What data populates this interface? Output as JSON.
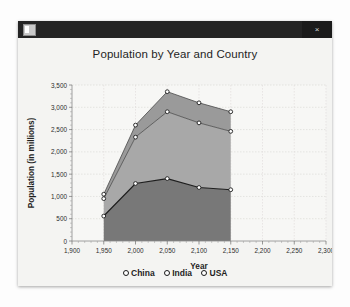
{
  "window": {
    "app_icon": "application-icon",
    "close_label": "×"
  },
  "chart_data": {
    "type": "area",
    "stacked": true,
    "title": "Population by Year and Country",
    "xlabel": "Year",
    "ylabel": "Population (in millions)",
    "x": [
      1950,
      2000,
      2050,
      2100,
      2150
    ],
    "xlim": [
      1900,
      2300
    ],
    "ylim": [
      0,
      3500
    ],
    "xticks": [
      "1,900",
      "1,950",
      "2,000",
      "2,050",
      "2,100",
      "2,150",
      "2,200",
      "2,250",
      "2,300"
    ],
    "xtick_values": [
      1900,
      1950,
      2000,
      2050,
      2100,
      2150,
      2200,
      2250,
      2300
    ],
    "yticks": [
      "0",
      "500",
      "1,000",
      "1,500",
      "2,000",
      "2,500",
      "3,000",
      "3,500"
    ],
    "ytick_values": [
      0,
      500,
      1000,
      1500,
      2000,
      2500,
      3000,
      3500
    ],
    "grid": true,
    "legend_position": "bottom",
    "series": [
      {
        "name": "China",
        "values": [
          560,
          1290,
          1400,
          1200,
          1150
        ],
        "color": "#787878"
      },
      {
        "name": "India",
        "values": [
          390,
          1040,
          1500,
          1450,
          1310
        ],
        "color": "#a8a8a8"
      },
      {
        "name": "USA",
        "values": [
          100,
          270,
          450,
          450,
          440
        ],
        "color": "#9a9a9a"
      }
    ],
    "cumulative_tops": [
      {
        "name": "China",
        "values": [
          560,
          1290,
          1400,
          1200,
          1150
        ]
      },
      {
        "name": "India",
        "values": [
          950,
          2330,
          2900,
          2650,
          2460
        ]
      },
      {
        "name": "USA",
        "values": [
          1050,
          2600,
          3350,
          3100,
          2900
        ]
      }
    ]
  }
}
